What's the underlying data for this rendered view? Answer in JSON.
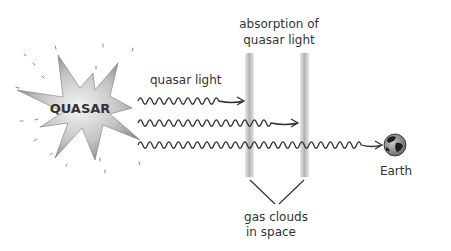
{
  "diagram": {
    "quasar_label": "QUASAR",
    "light_label": "quasar light",
    "absorption_label_line1": "absorption of",
    "absorption_label_line2": "quasar light",
    "gas_label_line1": "gas clouds",
    "gas_label_line2": "in space",
    "earth_label": "Earth",
    "colors": {
      "ink": "#333333",
      "cloud": "#b8b8b8",
      "burst_light": "#f2f2f2",
      "burst_dark": "#8a8a8a",
      "earth_ocean": "#9a9a9a",
      "earth_land": "#222222"
    }
  }
}
